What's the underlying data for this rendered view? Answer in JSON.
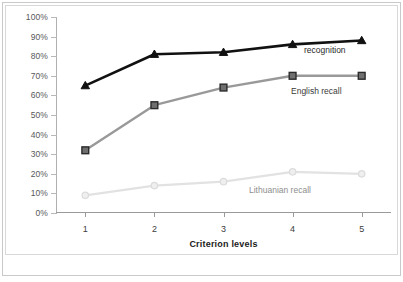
{
  "chart_data": {
    "type": "line",
    "title": "",
    "xlabel": "Criterion levels",
    "ylabel": "",
    "categories": [
      "1",
      "2",
      "3",
      "4",
      "5"
    ],
    "x": [
      1,
      2,
      3,
      4,
      5
    ],
    "ylim": [
      0,
      100
    ],
    "yticks": [
      0,
      10,
      20,
      30,
      40,
      50,
      60,
      70,
      80,
      90,
      100
    ],
    "ytick_labels": [
      "0%",
      "10%",
      "20%",
      "30%",
      "40%",
      "50%",
      "60%",
      "70%",
      "80%",
      "90%",
      "100%"
    ],
    "grid": false,
    "legend_position": "inline-annotations",
    "series": [
      {
        "name": "recognition",
        "values": [
          65,
          81,
          82,
          86,
          88
        ],
        "color": "#111111",
        "marker": "triangle",
        "label": "recognition"
      },
      {
        "name": "English recall",
        "values": [
          32,
          55,
          64,
          70,
          70
        ],
        "color": "#999999",
        "marker": "square",
        "label": "English recall"
      },
      {
        "name": "Lithuanian recall",
        "values": [
          9,
          14,
          16,
          21,
          20
        ],
        "color": "#e2e2e2",
        "marker": "circle",
        "label": "Lithuanian recall"
      }
    ],
    "annotations": [
      {
        "text": "recognition",
        "series": "recognition"
      },
      {
        "text": "English recall",
        "series": "English recall"
      },
      {
        "text": "Lithuanian recall",
        "series": "Lithuanian recall"
      }
    ]
  }
}
